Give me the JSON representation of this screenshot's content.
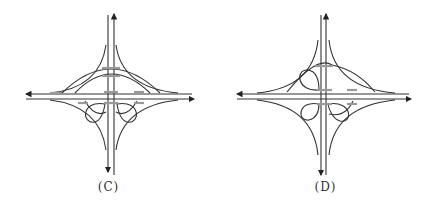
{
  "figure": {
    "panels": [
      {
        "label": "(C)",
        "description": "Cloverleaf-type interchange variant with two semi-circular loops on top and two loops below the horizontal road",
        "loops": {
          "top": "arc-ramps",
          "bottom": 2
        }
      },
      {
        "label": "(D)",
        "description": "Interchange variant with one loop on top-left and two loops below plus semi-directional arc on top-right",
        "loops": {
          "top": 1,
          "bottom": 2
        }
      }
    ],
    "colors": {
      "line": "#333333",
      "bridge": "#999999",
      "background": "#ffffff"
    }
  }
}
